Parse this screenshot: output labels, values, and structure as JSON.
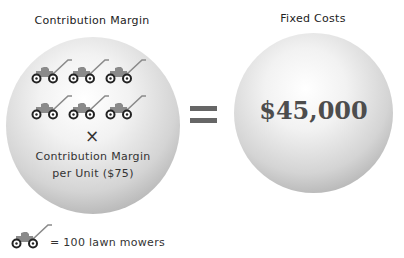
{
  "left": {
    "title": "Contribution Margin",
    "mower_rows": 2,
    "mowers_per_row": 3,
    "mower_count": 6,
    "operator": "×",
    "label_line1": "Contribution Margin",
    "label_line2": "per Unit ($75)"
  },
  "equals": "=",
  "right": {
    "title": "Fixed Costs",
    "value": "$45,000"
  },
  "legend": {
    "icon": "lawn-mower-icon",
    "text": "= 100 lawn mowers"
  },
  "colors": {
    "mower_body": "#8a8a8a",
    "wheel": "#222222",
    "equals": "#666666",
    "value_text": "#4d4d4d"
  }
}
